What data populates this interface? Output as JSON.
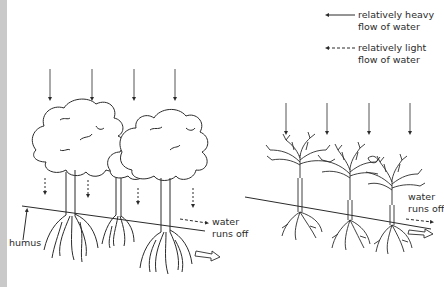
{
  "legend": {
    "heavy": {
      "line1": "relatively heavy",
      "line2": "flow of water",
      "style": "solid"
    },
    "light": {
      "line1": "relatively light",
      "line2": "flow of water",
      "style": "dashed"
    }
  },
  "left_panel": {
    "description": "Broad-canopy trees with humus layer; rain partly intercepted",
    "rain_arrows": 4,
    "drip_arrows": 4,
    "label_humus": "humus",
    "runoff": {
      "line1": "water",
      "line2": "runs off"
    }
  },
  "right_panel": {
    "description": "Sparse bare-branched trees; heavy rain reaches ground",
    "rain_arrows": 4,
    "runoff": {
      "line1": "water",
      "line2": "runs off"
    }
  },
  "colors": {
    "ink": "#2b2b2b",
    "background": "#ffffff",
    "edge_strip": "#c9c9c9"
  }
}
